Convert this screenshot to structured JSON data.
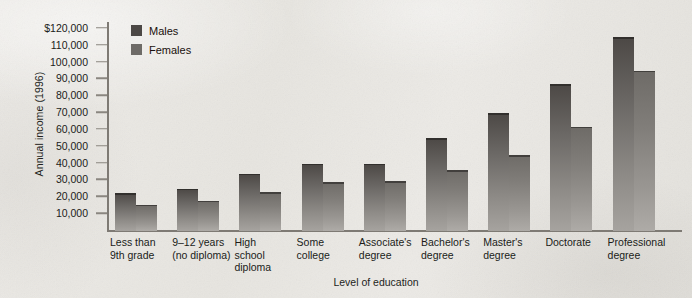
{
  "figure": {
    "background_color": "#e9e7e3",
    "axis_color": "#7e7a74"
  },
  "chart_data": {
    "type": "bar",
    "title": "",
    "xlabel": "Level of education",
    "ylabel": "Annual income (1996)",
    "categories": [
      "Less than\n9th grade",
      "9–12 years\n(no diploma)",
      "High\nschool\ndiploma",
      "Some\ncollege",
      "Associate's\ndegree",
      "Bachelor's\ndegree",
      "Master's\ndegree",
      "Doctorate",
      "Professional\ndegree"
    ],
    "series": [
      {
        "name": "Males",
        "color": "#4c4845",
        "values": [
          22500,
          25000,
          34000,
          40000,
          40000,
          55000,
          70000,
          87000,
          115000
        ]
      },
      {
        "name": "Females",
        "color": "#6e6b67",
        "values": [
          15500,
          18000,
          23000,
          29000,
          29500,
          36000,
          45000,
          62000,
          95000
        ]
      }
    ],
    "ylim": [
      0,
      125000
    ],
    "yticks": [
      10000,
      20000,
      30000,
      40000,
      50000,
      60000,
      70000,
      80000,
      90000,
      100000,
      110000,
      120000
    ],
    "ytick_labels": [
      "10,000",
      "20,000",
      "30,000",
      "40,000",
      "50,000",
      "60,000",
      "70,000",
      "80,000",
      "90,000",
      "100,000",
      "110,000",
      "$120,000"
    ],
    "grid": false,
    "legend_position": "top-left",
    "legend_entries": [
      "Males",
      "Females"
    ]
  }
}
